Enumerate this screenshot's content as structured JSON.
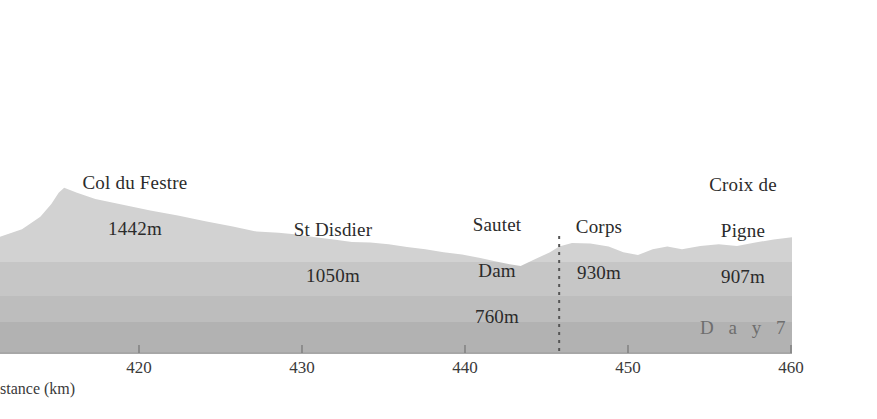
{
  "figure": {
    "background_color": "#ffffff",
    "plot_top_y": 30,
    "axis_y": 352
  },
  "chart_data": {
    "type": "area",
    "title": "",
    "subtitle": "",
    "xlabel": "Distance (km)",
    "ylabel": "",
    "xlim": [
      416.8,
      460.0
    ],
    "ylim": [
      0,
      1650
    ],
    "grid": false,
    "legend": "none",
    "series": [
      {
        "name": "Elevation profile",
        "fill_color": "#c9c9c9",
        "x": [
          416.8,
          418.0,
          419.0,
          419.6,
          420.0,
          420.3,
          421.0,
          422.0,
          423.5,
          425.0,
          426.5,
          428.0,
          429.5,
          430.8,
          432.0,
          433.0,
          434.0,
          435.0,
          436.0,
          437.0,
          438.0,
          439.0,
          440.0,
          441.0,
          442.0,
          443.0,
          443.8,
          444.6,
          445.2,
          446.0,
          446.8,
          447.3,
          448.0,
          449.0,
          450.0,
          450.8,
          451.6,
          452.4,
          453.2,
          454.0,
          455.0,
          456.0,
          457.0,
          458.0,
          459.0,
          460.0
        ],
        "elevation_m": [
          1015,
          1080,
          1190,
          1300,
          1400,
          1442,
          1400,
          1345,
          1295,
          1245,
          1200,
          1150,
          1105,
          1060,
          1050,
          1035,
          1010,
          990,
          970,
          965,
          950,
          925,
          905,
          880,
          860,
          830,
          800,
          775,
          760,
          820,
          880,
          930,
          960,
          955,
          930,
          880,
          855,
          905,
          930,
          905,
          935,
          950,
          935,
          965,
          990,
          1010
        ]
      }
    ],
    "tonal_bands": [
      {
        "from_y": 240,
        "to_y": 262,
        "color": "#d2d2d2"
      },
      {
        "from_y": 262,
        "to_y": 296,
        "color": "#c6c6c6"
      },
      {
        "from_y": 296,
        "to_y": 322,
        "color": "#bdbdbd"
      },
      {
        "from_y": 322,
        "to_y": 352,
        "color": "#b2b2b2"
      }
    ],
    "annotations": [
      {
        "name": "col-du-festre",
        "name_line": "Col du Festre",
        "elevation_line": "1442m",
        "x_km": 420.3
      },
      {
        "name": "st-disdier",
        "name_line": "St Disdier",
        "elevation_line": "1050m",
        "x_km": 432.0
      },
      {
        "name": "sautet-dam",
        "name_line": "Sautet\nDam",
        "elevation_line": "760m",
        "x_km": 445.2
      },
      {
        "name": "corps",
        "name_line": "Corps",
        "elevation_line": "930m",
        "x_km": 447.3
      },
      {
        "name": "croix-de-pigne",
        "name_line": "Croix de\nPigne",
        "elevation_line": "907m",
        "x_km": 456.0
      }
    ],
    "marker_line": {
      "name": "corps-marker",
      "x_km": 447.3,
      "style": "dotted",
      "color": "#555555"
    },
    "day_marker": {
      "label": "D a y  7",
      "x_km_start": 447.3,
      "x_km_end": 460.0
    },
    "xticks": [
      420,
      430,
      440,
      450,
      460
    ],
    "xtick_labels": [
      "420",
      "430",
      "440",
      "450",
      "460"
    ]
  },
  "labels": {
    "col_du_festre": {
      "line1": "Col du Festre",
      "line2": "1442m"
    },
    "st_disdier": {
      "line1": "St Disdier",
      "line2": "1050m"
    },
    "sautet_dam": {
      "line1": "Sautet",
      "line2": "Dam",
      "line3": "760m"
    },
    "corps": {
      "line1": "Corps",
      "line2": "930m"
    },
    "croix_de_pigne": {
      "line1": "Croix de",
      "line2": "Pigne",
      "line3": "907m"
    },
    "day": "D a y  7",
    "axis_title": "stance (km)"
  },
  "ticks": {
    "t420": "420",
    "t430": "430",
    "t440": "440",
    "t450": "450",
    "t460": "460"
  },
  "colors": {
    "band_1": "#d2d2d2",
    "band_2": "#c6c6c6",
    "band_3": "#bdbdbd",
    "band_4": "#b2b2b2",
    "text": "#2b2b2b",
    "axis": "#6b6b6b",
    "day_text": "#6e6e6e"
  }
}
